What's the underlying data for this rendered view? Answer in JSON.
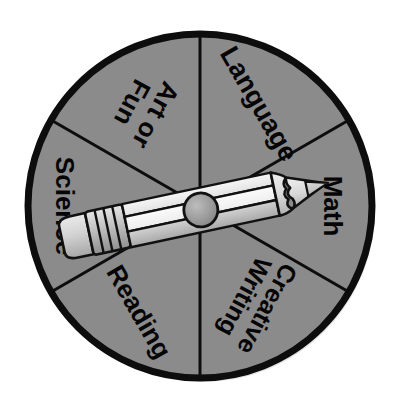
{
  "image": {
    "kind": "spinner-wheel-diagram",
    "title": "Subject Choice Spinner",
    "background_color": "#ffffff"
  },
  "wheel": {
    "center_x": 200,
    "center_y": 206,
    "radius": 172,
    "sector_count": 6,
    "sector_fill_color": "#8b8b8b",
    "outline_color": "#0d0d0d",
    "outline_width": 7,
    "divider_width": 3,
    "label_color": "#050505",
    "sectors": [
      {
        "id": "language",
        "label": "Language",
        "lines": [
          "Language"
        ],
        "start_angle": 30,
        "end_angle": 90,
        "label_angle": 60,
        "label_radius": 118,
        "text_rotation": 60,
        "font_size": 27
      },
      {
        "id": "math",
        "label": "Math",
        "lines": [
          "Math"
        ],
        "start_angle": 330,
        "end_angle": 30,
        "label_angle": 0,
        "label_radius": 133,
        "text_rotation": 90,
        "font_size": 26
      },
      {
        "id": "creative-writing",
        "label": "Creative Writing",
        "lines": [
          "Creative",
          "Writing"
        ],
        "start_angle": 270,
        "end_angle": 330,
        "label_angle": 300,
        "label_radius": 112,
        "text_rotation": 118,
        "font_size": 25
      },
      {
        "id": "reading",
        "label": "Reading",
        "lines": [
          "Reading"
        ],
        "start_angle": 210,
        "end_angle": 270,
        "label_angle": 240,
        "label_radius": 122,
        "text_rotation": 60,
        "font_size": 26
      },
      {
        "id": "science",
        "label": "Science",
        "lines": [
          "Science"
        ],
        "start_angle": 150,
        "end_angle": 210,
        "label_angle": 180,
        "label_radius": 135,
        "text_rotation": 90,
        "font_size": 26
      },
      {
        "id": "art-or-fun",
        "label": "Art or Fun",
        "lines": [
          "Art or",
          "Fun"
        ],
        "start_angle": 90,
        "end_angle": 150,
        "label_angle": 120,
        "label_radius": 112,
        "text_rotation": 118,
        "font_size": 26
      }
    ],
    "divider_angles": [
      30,
      90,
      150,
      210,
      270,
      330
    ]
  },
  "spinner": {
    "name": "pencil-pointer",
    "pointing_at": "Math",
    "rotation_degrees": -12,
    "length": 255,
    "colors": {
      "barrel_light": "#f2f2f2",
      "barrel_mid": "#d9d9d9",
      "barrel_shadow": "#a9a9a9",
      "eraser": "#cfcfcf",
      "ferrule": "#bdbdbd",
      "wood": "#e2e2e2",
      "graphite": "#c7c7c7",
      "outline": "#111111",
      "hub": "#9a9a9a"
    },
    "parts": [
      {
        "id": "eraser",
        "label": "eraser"
      },
      {
        "id": "ferrule",
        "label": "ferrule bands",
        "band_count": 3
      },
      {
        "id": "barrel",
        "label": "barrel"
      },
      {
        "id": "wood",
        "label": "sharpened wood cone"
      },
      {
        "id": "tip",
        "label": "graphite tip"
      },
      {
        "id": "hub",
        "label": "pivot hub",
        "radius": 17
      }
    ]
  }
}
